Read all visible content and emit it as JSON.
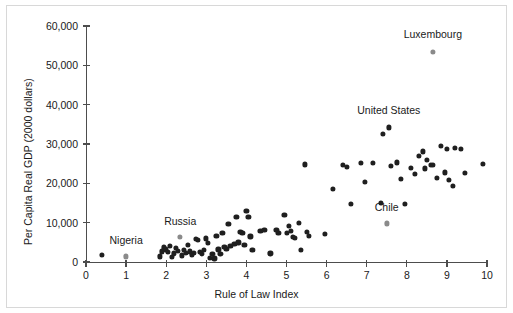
{
  "chart_data": {
    "type": "scatter",
    "title": "",
    "xlabel": "Rule of Law Index",
    "ylabel": "Per Capita Real GDP (2000 dollars)",
    "xlim": [
      0,
      10
    ],
    "ylim": [
      0,
      60000
    ],
    "xticks": [
      0,
      1,
      2,
      3,
      4,
      5,
      6,
      7,
      8,
      9,
      10
    ],
    "xticklabels": [
      "0",
      "1",
      "2",
      "3",
      "4",
      "5",
      "6",
      "7",
      "8",
      "9",
      "10"
    ],
    "yticks": [
      0,
      10000,
      20000,
      30000,
      40000,
      50000,
      60000
    ],
    "yticklabels": [
      "0",
      "10,000",
      "20,000",
      "30,000",
      "40,000",
      "50,000",
      "60,000"
    ],
    "grid": false,
    "legend": null,
    "marker_color": "#1f1f1f",
    "highlight_color": "#8a8a8a",
    "annotations": [
      {
        "label": "Nigeria",
        "x": 1.0,
        "y": 1400,
        "label_dx": 0.0,
        "label_dy": 4200
      },
      {
        "label": "Russia",
        "x": 2.35,
        "y": 6300,
        "label_dx": 0.0,
        "label_dy": 4200
      },
      {
        "label": "United States",
        "x": 7.55,
        "y": 34200,
        "label_dx": 0.0,
        "label_dy": 4500
      },
      {
        "label": "Luxembourg",
        "x": 8.65,
        "y": 53500,
        "label_dx": 0.0,
        "label_dy": 4500
      },
      {
        "label": "Chile",
        "x": 7.5,
        "y": 9800,
        "label_dx": 0.0,
        "label_dy": 4300
      }
    ],
    "highlighted_points": [
      {
        "name": "Nigeria",
        "x": 1.0,
        "y": 1400
      },
      {
        "name": "Russia",
        "x": 2.35,
        "y": 6300
      },
      {
        "name": "Luxembourg",
        "x": 8.65,
        "y": 53500
      },
      {
        "name": "Chile",
        "x": 7.5,
        "y": 9800
      }
    ],
    "points": [
      {
        "x": 0.4,
        "y": 1900
      },
      {
        "x": 1.85,
        "y": 1400
      },
      {
        "x": 1.9,
        "y": 2700
      },
      {
        "x": 1.95,
        "y": 3700
      },
      {
        "x": 2.0,
        "y": 3200
      },
      {
        "x": 2.05,
        "y": 2500
      },
      {
        "x": 2.1,
        "y": 4100
      },
      {
        "x": 2.15,
        "y": 1200
      },
      {
        "x": 2.2,
        "y": 2200
      },
      {
        "x": 2.25,
        "y": 3600
      },
      {
        "x": 2.3,
        "y": 2900
      },
      {
        "x": 2.4,
        "y": 1700
      },
      {
        "x": 2.45,
        "y": 3000
      },
      {
        "x": 2.5,
        "y": 2300
      },
      {
        "x": 2.55,
        "y": 4300
      },
      {
        "x": 2.6,
        "y": 2700
      },
      {
        "x": 2.65,
        "y": 1900
      },
      {
        "x": 2.7,
        "y": 2400
      },
      {
        "x": 2.75,
        "y": 5900
      },
      {
        "x": 2.8,
        "y": 5600
      },
      {
        "x": 2.85,
        "y": 2600
      },
      {
        "x": 2.9,
        "y": 2000
      },
      {
        "x": 2.95,
        "y": 3100
      },
      {
        "x": 3.0,
        "y": 6000
      },
      {
        "x": 3.05,
        "y": 4800
      },
      {
        "x": 3.1,
        "y": 1000
      },
      {
        "x": 3.15,
        "y": 2000
      },
      {
        "x": 3.2,
        "y": 900
      },
      {
        "x": 3.25,
        "y": 6700
      },
      {
        "x": 3.3,
        "y": 3200
      },
      {
        "x": 3.35,
        "y": 2100
      },
      {
        "x": 3.4,
        "y": 7500
      },
      {
        "x": 3.45,
        "y": 3900
      },
      {
        "x": 3.5,
        "y": 3400
      },
      {
        "x": 3.55,
        "y": 9600
      },
      {
        "x": 3.6,
        "y": 4000
      },
      {
        "x": 3.7,
        "y": 4600
      },
      {
        "x": 3.75,
        "y": 11500
      },
      {
        "x": 3.8,
        "y": 5000
      },
      {
        "x": 3.85,
        "y": 7700
      },
      {
        "x": 3.9,
        "y": 7400
      },
      {
        "x": 3.95,
        "y": 4300
      },
      {
        "x": 4.0,
        "y": 13000
      },
      {
        "x": 4.05,
        "y": 11500
      },
      {
        "x": 4.1,
        "y": 6500
      },
      {
        "x": 4.15,
        "y": 3000
      },
      {
        "x": 4.35,
        "y": 8000
      },
      {
        "x": 4.45,
        "y": 8100
      },
      {
        "x": 4.6,
        "y": 2200
      },
      {
        "x": 4.75,
        "y": 8200
      },
      {
        "x": 4.8,
        "y": 7400
      },
      {
        "x": 4.95,
        "y": 12000
      },
      {
        "x": 5.0,
        "y": 7500
      },
      {
        "x": 5.05,
        "y": 9100
      },
      {
        "x": 5.1,
        "y": 7900
      },
      {
        "x": 5.15,
        "y": 6400
      },
      {
        "x": 5.2,
        "y": 6200
      },
      {
        "x": 5.3,
        "y": 10000
      },
      {
        "x": 5.35,
        "y": 3100
      },
      {
        "x": 5.45,
        "y": 24800
      },
      {
        "x": 5.5,
        "y": 7600
      },
      {
        "x": 5.55,
        "y": 6700
      },
      {
        "x": 5.95,
        "y": 7100
      },
      {
        "x": 6.15,
        "y": 18500
      },
      {
        "x": 6.4,
        "y": 24700
      },
      {
        "x": 6.5,
        "y": 24200
      },
      {
        "x": 6.6,
        "y": 14700
      },
      {
        "x": 6.85,
        "y": 25200
      },
      {
        "x": 6.95,
        "y": 20400
      },
      {
        "x": 7.15,
        "y": 25200
      },
      {
        "x": 7.35,
        "y": 15000
      },
      {
        "x": 7.4,
        "y": 32600
      },
      {
        "x": 7.55,
        "y": 34200
      },
      {
        "x": 7.6,
        "y": 24500
      },
      {
        "x": 7.75,
        "y": 25300
      },
      {
        "x": 7.85,
        "y": 21100
      },
      {
        "x": 7.95,
        "y": 14800
      },
      {
        "x": 8.1,
        "y": 24000
      },
      {
        "x": 8.2,
        "y": 22300
      },
      {
        "x": 8.3,
        "y": 26900
      },
      {
        "x": 8.4,
        "y": 28100
      },
      {
        "x": 8.45,
        "y": 23800
      },
      {
        "x": 8.5,
        "y": 25900
      },
      {
        "x": 8.6,
        "y": 24600
      },
      {
        "x": 8.65,
        "y": 24600
      },
      {
        "x": 8.75,
        "y": 21400
      },
      {
        "x": 8.85,
        "y": 29500
      },
      {
        "x": 8.95,
        "y": 22800
      },
      {
        "x": 9.0,
        "y": 28800
      },
      {
        "x": 9.05,
        "y": 20800
      },
      {
        "x": 9.15,
        "y": 19400
      },
      {
        "x": 9.2,
        "y": 29000
      },
      {
        "x": 9.35,
        "y": 28700
      },
      {
        "x": 9.45,
        "y": 22600
      },
      {
        "x": 9.9,
        "y": 24900
      }
    ]
  }
}
